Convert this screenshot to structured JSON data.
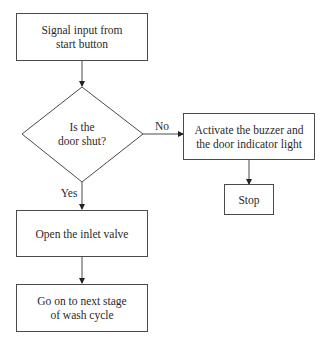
{
  "diagram": {
    "type": "flowchart",
    "nodes": {
      "start": {
        "shape": "rectangle",
        "text": "Signal input from start button"
      },
      "decision": {
        "shape": "diamond",
        "line1": "Is the",
        "line2": "door shut?"
      },
      "alarm": {
        "shape": "rectangle",
        "text": "Activate the buzzer and the door indicator light"
      },
      "stop": {
        "shape": "rectangle",
        "text": "Stop"
      },
      "open_valve": {
        "shape": "rectangle",
        "text": "Open the inlet valve"
      },
      "next_stage": {
        "shape": "rectangle",
        "text": "Go on to next stage of wash cycle"
      }
    },
    "edges": [
      {
        "from": "start",
        "to": "decision",
        "label": ""
      },
      {
        "from": "decision",
        "to": "alarm",
        "label": "No"
      },
      {
        "from": "decision",
        "to": "open_valve",
        "label": "Yes"
      },
      {
        "from": "alarm",
        "to": "stop",
        "label": ""
      },
      {
        "from": "open_valve",
        "to": "next_stage",
        "label": ""
      }
    ],
    "edge_labels": {
      "no": "No",
      "yes": "Yes"
    },
    "colors": {
      "stroke": "#4a4a4a",
      "background": "#ffffff",
      "text": "#2a2a2a"
    }
  }
}
